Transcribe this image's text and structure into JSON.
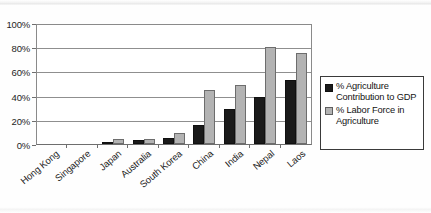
{
  "chart_data": {
    "type": "bar",
    "title": "",
    "xlabel": "",
    "ylabel": "",
    "ylim": [
      0,
      100
    ],
    "yticks": [
      "0%",
      "20%",
      "40%",
      "60%",
      "80%",
      "100%"
    ],
    "ytick_values": [
      0,
      20,
      40,
      60,
      80,
      100
    ],
    "grid": true,
    "legend_position": "right",
    "categories": [
      "Hong Kong",
      "Singapore",
      "Japan",
      "Australia",
      "South Korea",
      "China",
      "India",
      "Nepal",
      "Laos"
    ],
    "series": [
      {
        "name": "% Agriculture Contribution to GDP",
        "color": "#1a1a1a",
        "values": [
          0,
          0,
          2,
          3,
          5,
          16,
          29,
          39,
          53
        ]
      },
      {
        "name": "% Labor Force in Agriculture",
        "color": "#b3b3b3",
        "values": [
          0,
          0,
          4,
          4,
          9,
          45,
          49,
          80,
          75
        ]
      }
    ]
  },
  "legend": {
    "entries": [
      {
        "label": "% Agriculture Contribution to GDP",
        "swatch": "black-swatch"
      },
      {
        "label": "% Labor Force in Agriculture",
        "swatch": "gray-swatch"
      }
    ]
  }
}
